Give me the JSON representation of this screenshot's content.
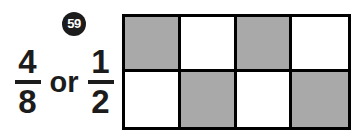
{
  "item": {
    "number": "59"
  },
  "expression": {
    "first_fraction": {
      "numerator": "4",
      "denominator": "8"
    },
    "conjunction": "or",
    "second_fraction": {
      "numerator": "1",
      "denominator": "2"
    }
  },
  "model": {
    "rows": 2,
    "columns": 4,
    "total_cells": 8,
    "shaded_cells": 4,
    "pattern": "checkerboard",
    "cells": [
      {
        "row": 1,
        "col": 1,
        "shaded": true
      },
      {
        "row": 1,
        "col": 2,
        "shaded": false
      },
      {
        "row": 1,
        "col": 3,
        "shaded": true
      },
      {
        "row": 1,
        "col": 4,
        "shaded": false
      },
      {
        "row": 2,
        "col": 1,
        "shaded": false
      },
      {
        "row": 2,
        "col": 2,
        "shaded": true
      },
      {
        "row": 2,
        "col": 3,
        "shaded": false
      },
      {
        "row": 2,
        "col": 4,
        "shaded": true
      }
    ]
  },
  "colors": {
    "background": "#ffffff",
    "ink": "#1c1c1c",
    "grid_line": "#000000",
    "shaded_fill": "#a9a9a9",
    "unshaded_fill": "#ffffff",
    "badge_fill": "#1c1c1c",
    "badge_text": "#ffffff"
  }
}
